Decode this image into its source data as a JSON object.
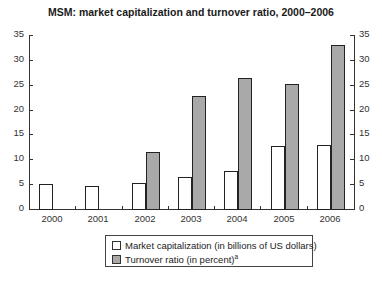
{
  "chart_data": {
    "type": "bar",
    "title": "MSM: market capitalization and turnover ratio, 2000–2006",
    "xlabel": "",
    "ylabel": "",
    "ylim": [
      0,
      35
    ],
    "yticks": [
      0,
      5,
      10,
      15,
      20,
      25,
      30,
      35
    ],
    "secondary_yticks": [
      0,
      5,
      10,
      15,
      20,
      25,
      30,
      35
    ],
    "grid": false,
    "legend_position": "bottom",
    "categories": [
      "2000",
      "2001",
      "2002",
      "2003",
      "2004",
      "2005",
      "2006"
    ],
    "series": [
      {
        "name": "Market capitalization (in billions of US dollars)",
        "color": "#ffffff",
        "values": [
          5.1,
          4.6,
          5.2,
          6.5,
          7.6,
          12.7,
          12.8
        ]
      },
      {
        "name": "Turnover ratio (in percent)",
        "footnote": "a",
        "color": "#a9a9a9",
        "values": [
          null,
          null,
          11.5,
          22.7,
          26.3,
          25.2,
          33.0
        ]
      }
    ]
  }
}
